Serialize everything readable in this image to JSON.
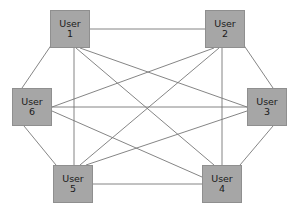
{
  "diagram": {
    "type": "complete-graph",
    "node_count": 6,
    "edge_count": 15,
    "background_color": "#ffffff",
    "node_fill_color": "#a6a6a6",
    "node_border_color": "#8f8f8f",
    "node_text_color": "#1a1a1a",
    "edge_color": "#777777",
    "nodes": [
      {
        "id": "user1",
        "name": "User",
        "number": "1",
        "x": 50,
        "y": 10,
        "w": 40,
        "h": 38
      },
      {
        "id": "user2",
        "name": "User",
        "number": "2",
        "x": 205,
        "y": 10,
        "w": 40,
        "h": 38
      },
      {
        "id": "user3",
        "name": "User",
        "number": "3",
        "x": 247,
        "y": 88,
        "w": 40,
        "h": 38
      },
      {
        "id": "user4",
        "name": "User",
        "number": "4",
        "x": 202,
        "y": 165,
        "w": 40,
        "h": 38
      },
      {
        "id": "user5",
        "name": "User",
        "number": "5",
        "x": 53,
        "y": 165,
        "w": 40,
        "h": 38
      },
      {
        "id": "user6",
        "name": "User",
        "number": "6",
        "x": 12,
        "y": 88,
        "w": 40,
        "h": 38
      }
    ],
    "edges": [
      {
        "id": "e-1-2",
        "from": "user1",
        "to": "user2",
        "x1": 90,
        "y1": 29,
        "x2": 205,
        "y2": 29
      },
      {
        "id": "e-1-3",
        "from": "user1",
        "to": "user3",
        "x1": 80,
        "y1": 48,
        "x2": 247,
        "y2": 107
      },
      {
        "id": "e-1-4",
        "from": "user1",
        "to": "user4",
        "x1": 76,
        "y1": 48,
        "x2": 214,
        "y2": 165
      },
      {
        "id": "e-1-5",
        "from": "user1",
        "to": "user5",
        "x1": 74,
        "y1": 48,
        "x2": 74,
        "y2": 165
      },
      {
        "id": "e-1-6",
        "from": "user1",
        "to": "user6",
        "x1": 52,
        "y1": 44,
        "x2": 22,
        "y2": 88
      },
      {
        "id": "e-2-3",
        "from": "user2",
        "to": "user3",
        "x1": 243,
        "y1": 44,
        "x2": 273,
        "y2": 88
      },
      {
        "id": "e-2-4",
        "from": "user2",
        "to": "user4",
        "x1": 222,
        "y1": 48,
        "x2": 222,
        "y2": 165
      },
      {
        "id": "e-2-5",
        "from": "user2",
        "to": "user5",
        "x1": 219,
        "y1": 48,
        "x2": 80,
        "y2": 165
      },
      {
        "id": "e-2-6",
        "from": "user2",
        "to": "user6",
        "x1": 214,
        "y1": 48,
        "x2": 52,
        "y2": 107
      },
      {
        "id": "e-3-4",
        "from": "user3",
        "to": "user4",
        "x1": 273,
        "y1": 126,
        "x2": 240,
        "y2": 165
      },
      {
        "id": "e-3-5",
        "from": "user3",
        "to": "user5",
        "x1": 247,
        "y1": 111,
        "x2": 86,
        "y2": 165
      },
      {
        "id": "e-3-6",
        "from": "user3",
        "to": "user6",
        "x1": 247,
        "y1": 107,
        "x2": 52,
        "y2": 107
      },
      {
        "id": "e-4-5",
        "from": "user4",
        "to": "user5",
        "x1": 202,
        "y1": 184,
        "x2": 93,
        "y2": 184
      },
      {
        "id": "e-4-6",
        "from": "user4",
        "to": "user6",
        "x1": 202,
        "y1": 177,
        "x2": 52,
        "y2": 111
      },
      {
        "id": "e-5-6",
        "from": "user5",
        "to": "user6",
        "x1": 56,
        "y1": 165,
        "x2": 24,
        "y2": 126
      }
    ]
  }
}
